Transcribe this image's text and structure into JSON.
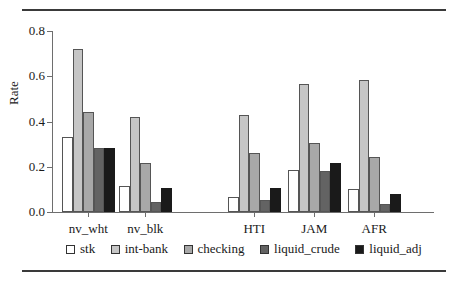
{
  "chart_data": {
    "type": "bar",
    "title": "",
    "xlabel": "",
    "ylabel": "Rate",
    "ylim": [
      0.0,
      0.8
    ],
    "yticks": [
      "0.0",
      "0.2",
      "0.4",
      "0.6",
      "0.8"
    ],
    "ytick_values": [
      0.0,
      0.2,
      0.4,
      0.6,
      0.8
    ],
    "grid": false,
    "legend_position": "bottom",
    "categories": [
      "nv_wht",
      "nv_blk",
      "HTI",
      "JAM",
      "AFR"
    ],
    "series": [
      {
        "name": "stk",
        "color": "#ffffff",
        "values": [
          0.33,
          0.115,
          0.065,
          0.185,
          0.1
        ]
      },
      {
        "name": "int-bank",
        "color": "#c6c6c6",
        "values": [
          0.72,
          0.42,
          0.43,
          0.565,
          0.585
        ]
      },
      {
        "name": "checking",
        "color": "#a8a8a8",
        "values": [
          0.44,
          0.215,
          0.26,
          0.305,
          0.245
        ]
      },
      {
        "name": "liquid_crude",
        "color": "#636363",
        "values": [
          0.285,
          0.045,
          0.055,
          0.18,
          0.035
        ]
      },
      {
        "name": "liquid_adj",
        "color": "#1a1a1a",
        "values": [
          0.285,
          0.105,
          0.105,
          0.215,
          0.08
        ]
      }
    ]
  },
  "legend": {
    "items": [
      {
        "label": "stk"
      },
      {
        "label": "int-bank"
      },
      {
        "label": "checking"
      },
      {
        "label": "liquid_crude"
      },
      {
        "label": "liquid_adj"
      }
    ]
  }
}
